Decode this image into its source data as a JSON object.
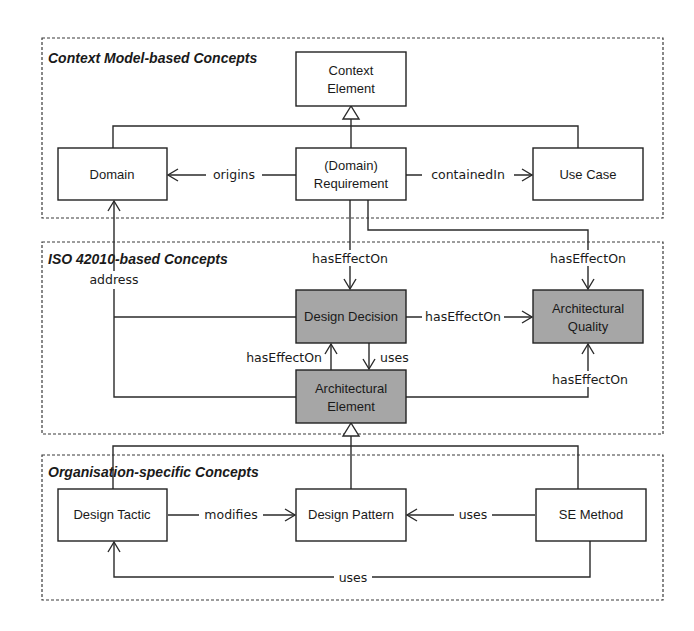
{
  "colors": {
    "plain_box_fill": "#ffffff",
    "iso_box_fill": "#a6a6a6",
    "stroke": "#222222",
    "background": "#ffffff"
  },
  "panels": [
    {
      "id": "context",
      "title": "Context Model-based Concepts"
    },
    {
      "id": "iso",
      "title": "ISO 42010-based Concepts"
    },
    {
      "id": "org",
      "title": "Organisation-specific Concepts"
    }
  ],
  "nodes": {
    "context_element": {
      "line1": "Context",
      "line2": "Element",
      "panel": "context",
      "shaded": false
    },
    "domain": {
      "line1": "Domain",
      "panel": "context",
      "shaded": false
    },
    "requirement": {
      "line1": "(Domain)",
      "line2": "Requirement",
      "panel": "context",
      "shaded": false
    },
    "use_case": {
      "line1": "Use Case",
      "panel": "context",
      "shaded": false
    },
    "design_decision": {
      "line1": "Design Decision",
      "panel": "iso",
      "shaded": true
    },
    "architectural_quality": {
      "line1": "Architectural",
      "line2": "Quality",
      "panel": "iso",
      "shaded": true
    },
    "architectural_element": {
      "line1": "Architectural",
      "line2": "Element",
      "panel": "iso",
      "shaded": true
    },
    "design_tactic": {
      "line1": "Design Tactic",
      "panel": "org",
      "shaded": false
    },
    "design_pattern": {
      "line1": "Design Pattern",
      "panel": "org",
      "shaded": false
    },
    "se_method": {
      "line1": "SE Method",
      "panel": "org",
      "shaded": false
    }
  },
  "edges": [
    {
      "from": "requirement",
      "to": "domain",
      "label": "origins"
    },
    {
      "from": "requirement",
      "to": "use_case",
      "label": "containedIn"
    },
    {
      "from": "requirement",
      "to": "design_decision",
      "label": "hasEffectOn"
    },
    {
      "from": "requirement",
      "to": "architectural_quality",
      "label": "hasEffectOn"
    },
    {
      "from": "design_decision",
      "to": "architectural_quality",
      "label": "hasEffectOn"
    },
    {
      "from": "architectural_element",
      "to": "design_decision",
      "label": "hasEffectOn"
    },
    {
      "from": "design_decision",
      "to": "architectural_element",
      "label": "uses"
    },
    {
      "from": "architectural_element",
      "to": "architectural_quality",
      "label": "hasEffectOn"
    },
    {
      "from": "design_decision",
      "to": "domain",
      "label": "address"
    },
    {
      "from": "design_tactic",
      "to": "design_pattern",
      "label": "modifies"
    },
    {
      "from": "se_method",
      "to": "design_pattern",
      "label": "uses"
    },
    {
      "from": "se_method",
      "to": "design_tactic",
      "label": "uses"
    }
  ],
  "generalizations": [
    {
      "parent": "context_element",
      "children": [
        "domain",
        "requirement",
        "use_case"
      ]
    },
    {
      "parent": "architectural_element",
      "children": [
        "design_tactic",
        "design_pattern",
        "se_method"
      ]
    }
  ]
}
